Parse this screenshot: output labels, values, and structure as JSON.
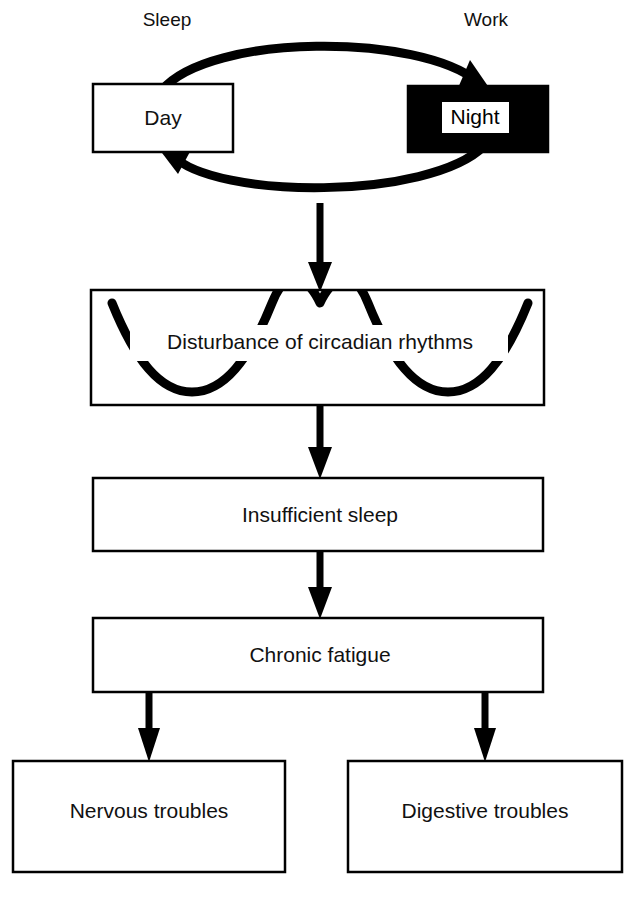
{
  "diagram": {
    "type": "flowchart",
    "background_color": "#ffffff",
    "stroke_color": "#000000",
    "text_color": "#111111",
    "headers": [
      {
        "id": "header-sleep",
        "label": "Sleep",
        "x": 167,
        "y": 21
      },
      {
        "id": "header-work",
        "label": "Work",
        "x": 486,
        "y": 21
      }
    ],
    "nodes": [
      {
        "id": "node-day",
        "label": "Day",
        "x": 93,
        "y": 84,
        "width": 140,
        "height": 68,
        "fill": "#ffffff",
        "text_fill": "#111111",
        "inverted": false
      },
      {
        "id": "node-night",
        "label": "Night",
        "x": 408,
        "y": 86,
        "width": 140,
        "height": 66,
        "fill": "#000000",
        "text_fill": "#000000",
        "inverted": true,
        "label_box": {
          "x": 442,
          "y": 102,
          "width": 67,
          "height": 31,
          "fill": "#ffffff"
        }
      },
      {
        "id": "node-circadian",
        "label": "Disturbance of circadian rhythms",
        "x": 91,
        "y": 290,
        "width": 453,
        "height": 115,
        "fill": "#ffffff",
        "text_fill": "#111111",
        "inverted": false,
        "has_wave": true
      },
      {
        "id": "node-insufficient-sleep",
        "label": "Insufficient sleep",
        "x": 93,
        "y": 478,
        "width": 450,
        "height": 73,
        "fill": "#ffffff",
        "text_fill": "#111111",
        "inverted": false
      },
      {
        "id": "node-chronic-fatigue",
        "label": "Chronic fatigue",
        "x": 93,
        "y": 618,
        "width": 450,
        "height": 74,
        "fill": "#ffffff",
        "text_fill": "#111111",
        "inverted": false
      },
      {
        "id": "node-nervous-troubles",
        "label": "Nervous troubles",
        "x": 13,
        "y": 761,
        "width": 272,
        "height": 111,
        "fill": "#ffffff",
        "text_fill": "#111111",
        "inverted": false
      },
      {
        "id": "node-digestive-troubles",
        "label": "Digestive troubles",
        "x": 348,
        "y": 761,
        "width": 274,
        "height": 111,
        "fill": "#ffffff",
        "text_fill": "#111111",
        "inverted": false
      }
    ],
    "edges": [
      {
        "id": "edge-day-to-night",
        "from": "node-day",
        "to": "node-night",
        "style": "curved-arc-top",
        "direction": "right"
      },
      {
        "id": "edge-night-to-day",
        "from": "node-night",
        "to": "node-day",
        "style": "curved-arc-bottom",
        "direction": "left"
      },
      {
        "id": "edge-cycle-to-circadian",
        "from": "cycle",
        "to": "node-circadian",
        "style": "straight-vertical"
      },
      {
        "id": "edge-circadian-to-sleep",
        "from": "node-circadian",
        "to": "node-insufficient-sleep",
        "style": "straight-vertical"
      },
      {
        "id": "edge-sleep-to-fatigue",
        "from": "node-insufficient-sleep",
        "to": "node-chronic-fatigue",
        "style": "straight-vertical"
      },
      {
        "id": "edge-fatigue-to-nervous",
        "from": "node-chronic-fatigue",
        "to": "node-nervous-troubles",
        "style": "branch-vertical"
      },
      {
        "id": "edge-fatigue-to-digestive",
        "from": "node-chronic-fatigue",
        "to": "node-digestive-troubles",
        "style": "branch-vertical"
      }
    ],
    "wave": {
      "description": "two-period sine wave behind the circadian label",
      "periods": 2,
      "stroke_width": 9
    }
  }
}
